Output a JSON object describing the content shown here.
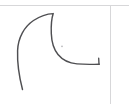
{
  "canvas": {
    "name": "sketch-canvas",
    "width": 129,
    "height": 104,
    "background_color": "#ffffff",
    "title": "Hand-drawn crescent sketch"
  },
  "guides": {
    "stroke_color": "#d7d7d9",
    "stroke_width": 1,
    "horizontal_rule": {
      "label": "horizontal guide line",
      "y": 5,
      "x1": 0,
      "x2": 129
    },
    "vertical_rule": {
      "label": "vertical guide line",
      "x": 110.5,
      "y1": 5,
      "y2": 104
    }
  },
  "drawing": {
    "stroke_color": "#4f4f52",
    "stroke_width": 1.45,
    "shape_name": "crescent-curve",
    "paths": [
      {
        "name": "crescent-outline",
        "label": "crescent outer arc and inner hook",
        "d": "M 22.5 89.5 C 19.5 78 17.2 62 17.6 50.5 C 18.1 37.5 24.5 26.5 33.5 20.5 C 41.5 15.2 48.5 13.8 53.2 13.6 C 51.6 18.5 51.0 26.5 51.3 33.5 C 51.6 41.5 53.5 49.0 58.0 54.5 C 62.5 60.0 69.5 63.2 77.0 63.9 C 85.0 64.6 93.5 64.4 99.2 64.2"
      }
    ],
    "ticks": [
      {
        "name": "end-hook-tick",
        "label": "short upward tick at stroke end",
        "d": "M 99.0 64.3 L 98.7 58.2"
      }
    ],
    "specks": [
      {
        "name": "ink-speck",
        "label": "faint ink speck",
        "cx": 62.0,
        "cy": 46.3,
        "r": 0.9
      }
    ]
  }
}
